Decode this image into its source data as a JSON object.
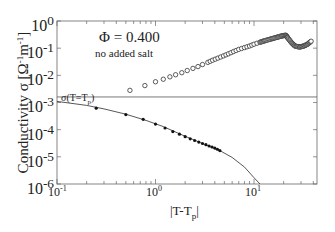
{
  "chart_data": {
    "type": "scatter",
    "title": "",
    "xlabel": "|T-T_p|",
    "ylabel": "Conductivity σ [Ω⁻¹m⁻¹]",
    "xscale": "log",
    "yscale": "log",
    "xlim": [
      0.1,
      45
    ],
    "ylim": [
      1e-06,
      1
    ],
    "grid": false,
    "x_ticks": [
      "10^-1",
      "10^0",
      "10^1"
    ],
    "y_ticks": [
      "10^0",
      "10^-1",
      "10^-2",
      "10^-3",
      "10^-4",
      "10^-5",
      "10^-6"
    ],
    "annotations": [
      {
        "text": "Φ = 0.400",
        "x": 0.45,
        "y": 0.25
      },
      {
        "text": "no added salt",
        "x": 0.45,
        "y": 0.1
      },
      {
        "text": "σ(T=T_p)",
        "x": 0.12,
        "y": 0.0025
      }
    ],
    "reference_line": {
      "name": "σ(T=T_p)",
      "y": 0.0016,
      "style": "horizontal solid thin"
    },
    "series": [
      {
        "name": "above percolation (open circles)",
        "marker": "open-circle",
        "x": [
          0.55,
          0.78,
          1.0,
          1.2,
          1.4,
          1.6,
          1.85,
          2.1,
          2.4,
          2.7,
          3.0,
          3.4,
          3.8,
          4.3,
          4.9,
          5.5,
          6.2,
          7.0,
          8.0,
          9.0,
          10.0,
          11.5,
          13,
          15,
          17,
          19,
          21,
          22,
          24,
          26,
          29,
          32,
          35,
          38
        ],
        "y": [
          0.0028,
          0.0042,
          0.0058,
          0.0072,
          0.0088,
          0.0105,
          0.0125,
          0.015,
          0.018,
          0.021,
          0.025,
          0.03,
          0.036,
          0.043,
          0.052,
          0.062,
          0.075,
          0.09,
          0.105,
          0.12,
          0.14,
          0.165,
          0.19,
          0.22,
          0.25,
          0.28,
          0.3,
          0.24,
          0.16,
          0.12,
          0.11,
          0.12,
          0.14,
          0.18
        ]
      },
      {
        "name": "below percolation (filled circles)",
        "marker": "filled-circle",
        "x": [
          0.25,
          0.5,
          0.75,
          1.0,
          1.25,
          1.5,
          1.75,
          2.0,
          2.25,
          2.5,
          2.75,
          3.0,
          3.25,
          3.5,
          3.75,
          4.0,
          4.25,
          4.5
        ],
        "y": [
          0.00062,
          0.00036,
          0.00024,
          0.00016,
          0.000115,
          8.5e-05,
          6.8e-05,
          5.5e-05,
          4.6e-05,
          4e-05,
          3.5e-05,
          3.1e-05,
          2.8e-05,
          2.5e-05,
          2.3e-05,
          2.1e-05,
          1.9e-05,
          1.7e-05
        ]
      },
      {
        "name": "fit curve",
        "marker": "line",
        "x": [
          0.1,
          0.2,
          0.3,
          0.5,
          0.8,
          1.2,
          2.0,
          3.0,
          4.5,
          6.0,
          8.0,
          10.0,
          11.5
        ],
        "y": [
          0.0011,
          0.00078,
          0.00058,
          0.00037,
          0.00022,
          0.00013,
          5.7e-05,
          3.1e-05,
          1.7e-05,
          9.5e-06,
          4.2e-06,
          1.7e-06,
          1e-06
        ]
      }
    ]
  },
  "axes": {
    "ylabel_prefix": "Conductivity  σ  [Ω",
    "ylabel_mid": "m",
    "ylabel_suffix": "]",
    "ylabel_exp": "-1",
    "xlabel_main": "|T-T",
    "xlabel_sub": "p",
    "xlabel_end": "|",
    "yticks": [
      {
        "base": "10",
        "exp": "0"
      },
      {
        "base": "10",
        "exp": "-1"
      },
      {
        "base": "10",
        "exp": "-2"
      },
      {
        "base": "10",
        "exp": "-3"
      },
      {
        "base": "10",
        "exp": "-4"
      },
      {
        "base": "10",
        "exp": "-5"
      },
      {
        "base": "10",
        "exp": "-6"
      }
    ],
    "xticks": [
      {
        "base": "10",
        "exp": "-1"
      },
      {
        "base": "10",
        "exp": "0"
      },
      {
        "base": "10",
        "exp": "1"
      }
    ]
  },
  "annotations": {
    "phi": "Φ = 0.400",
    "salt": "no added salt",
    "sigma_main": "σ(T=T",
    "sigma_sub": "p",
    "sigma_end": ")"
  }
}
